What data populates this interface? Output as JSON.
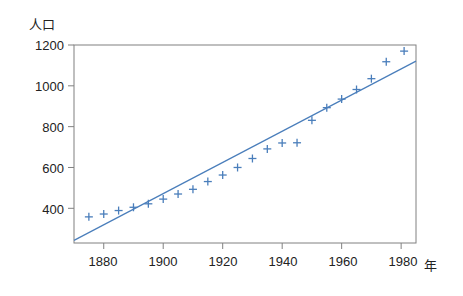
{
  "chart_data": {
    "type": "scatter",
    "title": "",
    "subtitle": "",
    "xlabel": "年",
    "ylabel": "人口",
    "xlim": [
      1870,
      1985
    ],
    "ylim": [
      230,
      1200
    ],
    "grid": false,
    "legend": null,
    "x_ticks": [
      1880,
      1900,
      1920,
      1940,
      1960,
      1980
    ],
    "y_ticks": [
      400,
      600,
      800,
      1000,
      1200
    ],
    "marker": "plus",
    "marker_color": "#4a7ebb",
    "line_color": "#4a7ebb",
    "series": [
      {
        "name": "人口",
        "type": "scatter",
        "x": [
          1875,
          1880,
          1885,
          1890,
          1895,
          1900,
          1905,
          1910,
          1915,
          1920,
          1925,
          1930,
          1935,
          1940,
          1945,
          1950,
          1955,
          1960,
          1965,
          1970,
          1975,
          1981
        ],
        "values": [
          358,
          372,
          389,
          405,
          422,
          445,
          470,
          493,
          531,
          563,
          600,
          644,
          691,
          720,
          721,
          831,
          893,
          935,
          982,
          1035,
          1118,
          1170
        ]
      },
      {
        "name": "回帰直線",
        "type": "line",
        "x": [
          1870,
          1985
        ],
        "values": [
          243,
          1121
        ]
      }
    ]
  },
  "labels": {
    "y_axis_title": "人口",
    "x_axis_title": "年",
    "y_tick_1200": "1200",
    "y_tick_1000": "1000",
    "y_tick_800": "800",
    "y_tick_600": "600",
    "y_tick_400": "400",
    "x_tick_1880": "1880",
    "x_tick_1900": "1900",
    "x_tick_1920": "1920",
    "x_tick_1940": "1940",
    "x_tick_1960": "1960",
    "x_tick_1980": "1980"
  },
  "colors": {
    "data": "#4a7ebb",
    "axis": "#808080",
    "text": "#222222",
    "background": "#ffffff"
  }
}
